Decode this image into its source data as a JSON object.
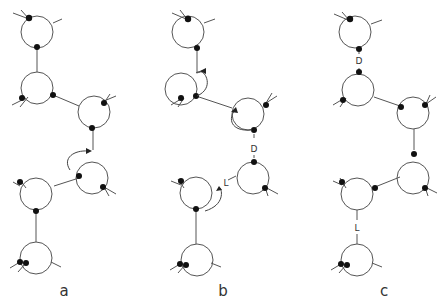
{
  "figure": {
    "panels": [
      {
        "id": "a",
        "label": "a",
        "label_pos": [
          64,
          296
        ],
        "circles": [
          [
            37,
            32
          ],
          [
            37,
            88
          ],
          [
            94,
            112
          ],
          [
            92,
            178
          ],
          [
            36,
            194
          ],
          [
            36,
            258
          ]
        ],
        "bond_labels": []
      },
      {
        "id": "b",
        "label": "b",
        "label_pos": [
          223,
          296
        ],
        "circles": [
          [
            188,
            32
          ],
          [
            181,
            89
          ],
          [
            248,
            114
          ],
          [
            253,
            183
          ],
          [
            196,
            193
          ],
          [
            197,
            260
          ]
        ],
        "bond_labels": [
          {
            "text": "D",
            "pos": [
              253,
              152
            ]
          },
          {
            "text": "L",
            "pos": [
              224,
              186
            ]
          }
        ]
      },
      {
        "id": "c",
        "label": "c",
        "label_pos": [
          384,
          296
        ],
        "circles": [
          [
            355,
            32
          ],
          [
            358,
            90
          ],
          [
            413,
            113
          ],
          [
            413,
            178
          ],
          [
            357,
            194
          ],
          [
            357,
            260
          ]
        ],
        "bond_labels": [
          {
            "text": "D",
            "pos": [
              359,
              64
            ]
          },
          {
            "text": "L",
            "pos": [
              357,
              231
            ]
          }
        ]
      }
    ],
    "radius": 16
  }
}
